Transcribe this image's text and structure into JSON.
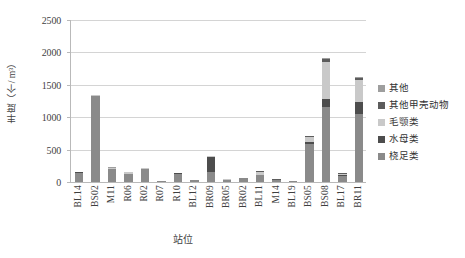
{
  "chart_data": {
    "type": "bar",
    "subtype": "stacked-vertical-bar",
    "title": "",
    "xlabel": "站位",
    "ylabel": "丰度（个/ m³）",
    "ylim": [
      0,
      2500
    ],
    "yticks": [
      0,
      500,
      1000,
      1500,
      2000,
      2500
    ],
    "grid": true,
    "legend_position": "right",
    "categories": [
      "BL14",
      "BS02",
      "M11",
      "R06",
      "R02",
      "R07",
      "R10",
      "BL12",
      "BR09",
      "BR05",
      "BR02",
      "BL11",
      "M14",
      "BL19",
      "BS05",
      "BS08",
      "BL17",
      "BR11"
    ],
    "series": [
      {
        "name": "桡足类",
        "color": "#8a8a8a",
        "values": [
          140,
          1320,
          200,
          125,
          195,
          12,
          130,
          28,
          150,
          35,
          55,
          110,
          30,
          10,
          590,
          1160,
          100,
          1050
        ]
      },
      {
        "name": "水母类",
        "color": "#4d4d4d",
        "values": [
          8,
          10,
          6,
          5,
          8,
          2,
          5,
          2,
          240,
          3,
          4,
          6,
          4,
          2,
          35,
          120,
          12,
          190
        ]
      },
      {
        "name": "毛颚类",
        "color": "#c9c9c9",
        "values": [
          5,
          8,
          12,
          20,
          8,
          1,
          4,
          3,
          10,
          3,
          5,
          45,
          5,
          2,
          75,
          580,
          15,
          330
        ]
      },
      {
        "name": "其他甲壳动物",
        "color": "#5c5c5c",
        "values": [
          4,
          6,
          5,
          4,
          6,
          1,
          3,
          2,
          5,
          2,
          3,
          5,
          3,
          1,
          10,
          40,
          5,
          35
        ]
      },
      {
        "name": "其他",
        "color": "#9e9e9e",
        "values": [
          3,
          4,
          3,
          3,
          4,
          1,
          2,
          1,
          3,
          1,
          2,
          3,
          2,
          1,
          5,
          20,
          3,
          20
        ]
      }
    ]
  },
  "axis": {
    "y_title": "丰度（个/ m³）",
    "x_title": "站位"
  },
  "legend": {
    "items": [
      {
        "label": "其他",
        "color": "#9e9e9e"
      },
      {
        "label": "其他甲壳动物",
        "color": "#5c5c5c"
      },
      {
        "label": "毛颚类",
        "color": "#c9c9c9"
      },
      {
        "label": "水母类",
        "color": "#4d4d4d"
      },
      {
        "label": "桡足类",
        "color": "#8a8a8a"
      }
    ]
  },
  "colors": {
    "gridline": "#d4d4d4",
    "axis": "#b9b9b9",
    "text": "#3f3f3f",
    "background": "#ffffff"
  }
}
